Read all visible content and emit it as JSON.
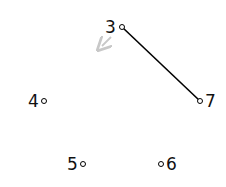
{
  "diagram": {
    "nodes": [
      {
        "id": "3",
        "label": "3",
        "cx": 122,
        "cy": 27,
        "lx": 105,
        "ly": 33
      },
      {
        "id": "4",
        "label": "4",
        "cx": 43,
        "cy": 101,
        "lx": 28,
        "ly": 107
      },
      {
        "id": "5",
        "label": "5",
        "cx": 83,
        "cy": 164,
        "lx": 67,
        "ly": 170
      },
      {
        "id": "6",
        "label": "6",
        "cx": 161,
        "cy": 164,
        "lx": 166,
        "ly": 170
      },
      {
        "id": "7",
        "label": "7",
        "cx": 200,
        "cy": 101,
        "lx": 205,
        "ly": 107
      }
    ],
    "edges": [
      {
        "from": "3",
        "to": "7",
        "color": "#000000"
      }
    ],
    "arrow": {
      "from": [
        111,
        37
      ],
      "to": [
        101,
        47
      ],
      "color": "#c8c8c8"
    }
  }
}
